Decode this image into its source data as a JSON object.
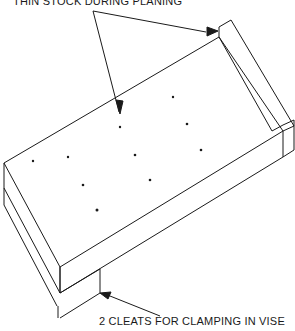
{
  "diagram": {
    "type": "isometric technical illustration",
    "labels": {
      "top": "THIN STOCK DURING PLANING",
      "bottom": "2 CLEATS FOR CLAMPING IN VISE"
    },
    "colors": {
      "line": "#1a1a1a",
      "background": "#ffffff"
    }
  }
}
